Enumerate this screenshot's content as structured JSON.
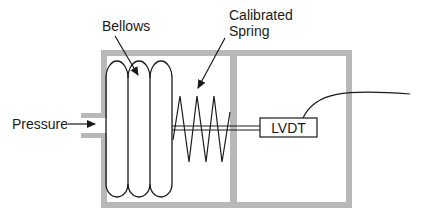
{
  "diagram": {
    "labels": {
      "bellows": "Bellows",
      "spring_line1": "Calibrated",
      "spring_line2": "Spring",
      "pressure": "Pressure",
      "lvdt": "LVDT"
    },
    "colors": {
      "housing": "#b8b8b8",
      "stroke": "#1a1a1a",
      "background": "#ffffff"
    }
  }
}
